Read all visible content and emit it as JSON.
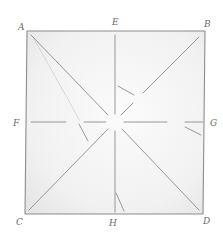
{
  "diagram": {
    "type": "geometric-construction",
    "style": "hand-drawn pencil sketch",
    "colors": {
      "paper": "#ffffff",
      "fill_light": "#f3f3f3",
      "fill_shade": "#e2e2e2",
      "stroke": "#8c8c8c",
      "stroke_light": "#b5b5b5",
      "label": "#6a6a6a"
    },
    "square": {
      "corners": {
        "A": {
          "x": 27,
          "y": 31
        },
        "B": {
          "x": 205,
          "y": 31
        },
        "C": {
          "x": 25,
          "y": 214
        },
        "D": {
          "x": 203,
          "y": 214
        }
      }
    },
    "midpoints": {
      "E": {
        "x": 115,
        "y": 31
      },
      "F": {
        "x": 27,
        "y": 122
      },
      "G": {
        "x": 205,
        "y": 122
      },
      "H": {
        "x": 115,
        "y": 214
      }
    },
    "center": {
      "x": 115,
      "y": 122
    },
    "labels": [
      {
        "id": "label-a",
        "text": "A",
        "x": 18,
        "y": 30
      },
      {
        "id": "label-e",
        "text": "E",
        "x": 112,
        "y": 25
      },
      {
        "id": "label-b",
        "text": "B",
        "x": 204,
        "y": 27
      },
      {
        "id": "label-f",
        "text": "F",
        "x": 13,
        "y": 126
      },
      {
        "id": "label-g",
        "text": "G",
        "x": 210,
        "y": 126
      },
      {
        "id": "label-c",
        "text": "C",
        "x": 16,
        "y": 225
      },
      {
        "id": "label-h",
        "text": "H",
        "x": 109,
        "y": 226
      },
      {
        "id": "label-d",
        "text": "D",
        "x": 203,
        "y": 224
      }
    ],
    "segments": [
      {
        "id": "diag-a-center",
        "x1": 31,
        "y1": 35,
        "x2": 108,
        "y2": 115
      },
      {
        "id": "diag-center-d",
        "x1": 122,
        "y1": 129,
        "x2": 199,
        "y2": 210
      },
      {
        "id": "diag-b-center",
        "x1": 199,
        "y1": 37,
        "x2": 143,
        "y2": 93
      },
      {
        "id": "diag-center-b-inner",
        "x1": 133,
        "y1": 103,
        "x2": 121,
        "y2": 115
      },
      {
        "id": "diag-center-c",
        "x1": 108,
        "y1": 129,
        "x2": 29,
        "y2": 210
      },
      {
        "id": "mid-e-center",
        "x1": 115,
        "y1": 35,
        "x2": 115,
        "y2": 114
      },
      {
        "id": "mid-center-h",
        "x1": 115,
        "y1": 131,
        "x2": 115,
        "y2": 212
      },
      {
        "id": "mid-f-left",
        "x1": 31,
        "y1": 122,
        "x2": 66,
        "y2": 122
      },
      {
        "id": "mid-f-inner",
        "x1": 84,
        "y1": 122,
        "x2": 106,
        "y2": 122
      },
      {
        "id": "mid-g-inner",
        "x1": 124,
        "y1": 122,
        "x2": 167,
        "y2": 122
      },
      {
        "id": "mid-g-right",
        "x1": 185,
        "y1": 122,
        "x2": 203,
        "y2": 122
      },
      {
        "id": "fold-e-small",
        "x1": 118,
        "y1": 86,
        "x2": 134,
        "y2": 95
      },
      {
        "id": "fold-f-small",
        "x1": 79,
        "y1": 124,
        "x2": 88,
        "y2": 141
      },
      {
        "id": "fold-g-small",
        "x1": 185,
        "y1": 127,
        "x2": 201,
        "y2": 135
      },
      {
        "id": "fold-h-small",
        "x1": 116,
        "y1": 193,
        "x2": 124,
        "y2": 211
      }
    ],
    "faint_segments": [
      {
        "id": "faint-a-fold",
        "x1": 33,
        "y1": 37,
        "x2": 80,
        "y2": 121
      }
    ]
  }
}
